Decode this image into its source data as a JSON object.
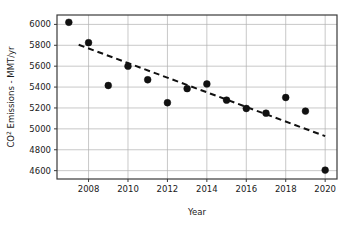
{
  "chart_data": {
    "type": "scatter",
    "title": "",
    "xlabel": "Year",
    "ylabel": "CO2 Emissions - MMT/yr",
    "ylabel_prefix": "CO",
    "ylabel_superscript": "2",
    "ylabel_suffix": " Emissions - MMT/yr",
    "x": [
      2007,
      2008,
      2009,
      2010,
      2011,
      2012,
      2013,
      2014,
      2015,
      2016,
      2017,
      2018,
      2019,
      2020
    ],
    "values": [
      6020,
      5825,
      5415,
      5600,
      5470,
      5250,
      5385,
      5430,
      5275,
      5195,
      5150,
      5300,
      5170,
      4605
    ],
    "series": [
      {
        "name": "CO2 Emissions",
        "marker": "filled-circle",
        "color": "#111111",
        "values": [
          6020,
          5825,
          5415,
          5600,
          5470,
          5250,
          5385,
          5430,
          5275,
          5195,
          5150,
          5300,
          5170,
          4605
        ]
      },
      {
        "name": "Linear trend",
        "style": "dashed-line",
        "color": "#111111",
        "x_endpoints": [
          2007.5,
          2020.0
        ],
        "y_endpoints": [
          5805,
          4930
        ]
      }
    ],
    "xlim": [
      2006.4,
      2020.6
    ],
    "ylim": [
      4520,
      6090
    ],
    "xticks": [
      2008,
      2010,
      2012,
      2014,
      2016,
      2018,
      2020
    ],
    "xtick_labels": [
      "2008",
      "2010",
      "2012",
      "2014",
      "2016",
      "2018",
      "2020"
    ],
    "yticks": [
      4600,
      4800,
      5000,
      5200,
      5400,
      5600,
      5800,
      6000
    ],
    "ytick_labels": [
      "4600",
      "4800",
      "5000",
      "5200",
      "5400",
      "5600",
      "5800",
      "6000"
    ],
    "grid": true,
    "grid_color": "#b0b0b0",
    "legend": "none",
    "frame_color": "#3a3a3a",
    "background": "#ffffff"
  }
}
